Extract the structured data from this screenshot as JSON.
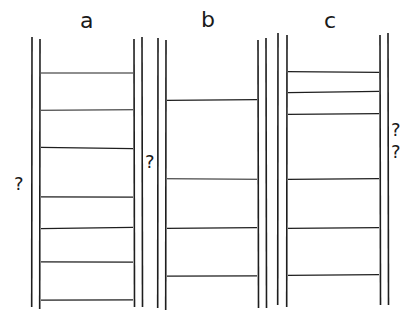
{
  "figure": {
    "type": "schematic diagram",
    "stroke_color": "#1e1e1e",
    "background": "#ffffff",
    "columns": [
      {
        "id": "a",
        "label": "a",
        "walls": {
          "outer_left": 32,
          "inner_left": 40,
          "inner_right": 134,
          "outer_right": 142,
          "top": 37,
          "bottom": 307
        },
        "layers": [
          {
            "rows": 1,
            "shelf_y": 73,
            "grain_count": 10
          },
          {
            "rows": 1,
            "shelf_y": 110,
            "grain_count": 9
          },
          {
            "rows": 1,
            "shelf_y": 148,
            "grain_count": 10
          },
          {
            "rows": 2,
            "shelf_y": 197,
            "grain_count": 16
          },
          {
            "rows": 1,
            "shelf_y": 228,
            "grain_count": 8
          },
          {
            "rows": 1,
            "shelf_y": 262,
            "grain_count": 9
          },
          {
            "rows": 1,
            "shelf_y": 300,
            "grain_count": 10
          }
        ]
      },
      {
        "id": "b",
        "label": "b",
        "walls": {
          "outer_left": 158,
          "inner_left": 166,
          "inner_right": 258,
          "outer_right": 266,
          "top": 38,
          "bottom": 308
        },
        "layers": [
          {
            "rows": 2,
            "shelf_y": 100,
            "grain_count": 16
          },
          {
            "rows": 2,
            "shelf_y": 179,
            "grain_count": 18
          },
          {
            "rows": 2,
            "shelf_y": 228,
            "grain_count": 17
          },
          {
            "rows": 2,
            "shelf_y": 276,
            "grain_count": 17
          }
        ]
      },
      {
        "id": "c",
        "label": "c",
        "walls": {
          "outer_left": 278,
          "inner_left": 287,
          "inner_right": 380,
          "outer_right": 388,
          "top": 33,
          "bottom": 305
        },
        "layers": [
          {
            "rows": 1,
            "shelf_y": 72,
            "grain_count": 6
          },
          {
            "rows": 1,
            "shelf_y": 92,
            "grain_count": 6
          },
          {
            "rows": 1,
            "shelf_y": 114,
            "grain_count": 7
          },
          {
            "rows": 3,
            "shelf_y": 179,
            "grain_count": 22
          },
          {
            "rows": 2,
            "shelf_y": 228,
            "grain_count": 16
          },
          {
            "rows": 2,
            "shelf_y": 275,
            "grain_count": 17
          }
        ]
      }
    ],
    "question_marks": [
      {
        "text": "?",
        "x": 14,
        "y": 174,
        "near": "column a"
      },
      {
        "text": "?",
        "x": 145,
        "y": 152,
        "near": "between a and b"
      },
      {
        "text": "?",
        "x": 390,
        "y": 122,
        "near": "column c"
      },
      {
        "text": "?",
        "x": 390,
        "y": 144,
        "near": "column c"
      }
    ]
  }
}
